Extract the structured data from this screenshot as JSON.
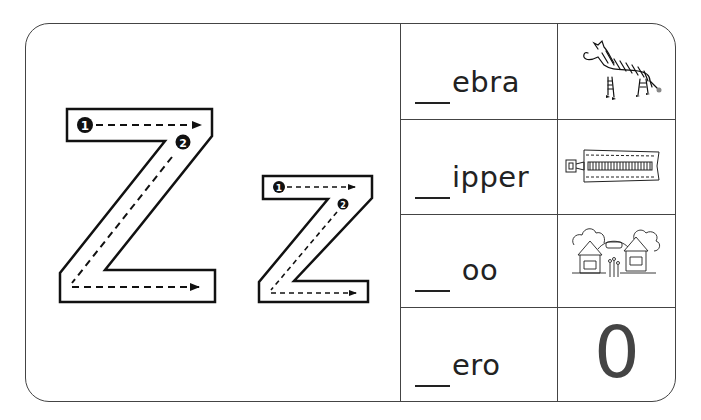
{
  "worksheet": {
    "letter_upper": "Z",
    "letter_lower": "z",
    "stroke_order_labels": [
      "1",
      "2"
    ],
    "rows": [
      {
        "blank": "__",
        "word_suffix": "ebra",
        "picture": "zebra-image"
      },
      {
        "blank": "__",
        "word_suffix": "ipper",
        "picture": "zipper-image"
      },
      {
        "blank": "__",
        "word_suffix": " oo",
        "picture": "zoo-image"
      },
      {
        "blank": "__",
        "word_suffix": "ero",
        "picture": "zero-numeral",
        "picture_text": "0"
      }
    ]
  },
  "colors": {
    "ink": "#222222",
    "border": "#444444",
    "numeral": "#444444"
  }
}
